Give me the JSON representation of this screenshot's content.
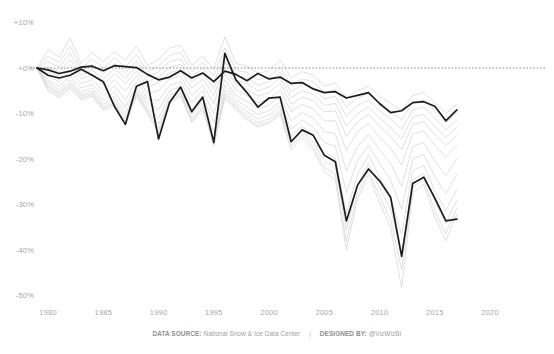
{
  "footer": {
    "source_label": "DATA SOURCE:",
    "source_value": "National Snow & Ice Data Center",
    "separator": "|",
    "designer_label": "DESIGNED BY:",
    "designer_value": "@VizWizBI"
  },
  "colors": {
    "background": "#ffffff",
    "axis_text": "#a6a6a6",
    "context_line": "#d6d6d6",
    "highlight_line": "#1d1d1d",
    "zero_reference_line": "#6f6f6f"
  },
  "chart_data": {
    "type": "line",
    "title": "",
    "subtitle": "",
    "xlabel": "",
    "ylabel": "",
    "xlim": [
      1979,
      2021
    ],
    "ylim": [
      -52,
      12
    ],
    "grid": false,
    "legend_position": "none",
    "y_tick_labels": [
      "+10%",
      "+0%",
      "-10%",
      "-20%",
      "-30%",
      "-40%",
      "-50%"
    ],
    "y_tick_values": [
      10,
      0,
      -10,
      -20,
      -30,
      -40,
      -50
    ],
    "x_tick_labels": [
      "1980",
      "1985",
      "1990",
      "1995",
      "2000",
      "2005",
      "2010",
      "2015",
      "2020"
    ],
    "x_tick_values": [
      1980,
      1985,
      1990,
      1995,
      2000,
      2005,
      2010,
      2015,
      2020
    ],
    "annotations": [
      {
        "name": "zero-reference-line",
        "type": "hline",
        "value": 0,
        "style": "dotted"
      }
    ],
    "x": [
      1979,
      1980,
      1981,
      1982,
      1983,
      1984,
      1985,
      1986,
      1987,
      1988,
      1989,
      1990,
      1991,
      1992,
      1993,
      1994,
      1995,
      1996,
      1997,
      1998,
      1999,
      2000,
      2001,
      2002,
      2003,
      2004,
      2005,
      2006,
      2007,
      2008,
      2009,
      2010,
      2011,
      2012,
      2013,
      2014,
      2015,
      2016,
      2017
    ],
    "series": [
      {
        "name": "Highlighted A",
        "emphasis": "high",
        "color": "#1d1d1d",
        "values": [
          0.0,
          -0.4,
          -1.2,
          -0.7,
          0.2,
          0.4,
          -0.6,
          0.5,
          0.3,
          0.1,
          -1.4,
          -2.6,
          -2.0,
          -0.6,
          -2.2,
          -1.1,
          -3.0,
          -0.7,
          -1.4,
          -2.8,
          -1.2,
          -2.4,
          -2.0,
          -3.4,
          -3.2,
          -4.6,
          -5.4,
          -5.2,
          -6.6,
          -6.0,
          -5.4,
          -7.8,
          -9.8,
          -9.4,
          -7.6,
          -7.4,
          -8.4,
          -11.6,
          -9.2
        ]
      },
      {
        "name": "Highlighted B",
        "emphasis": "high",
        "color": "#1d1d1d",
        "values": [
          0.0,
          -1.6,
          -2.2,
          -1.6,
          -0.3,
          -1.6,
          -3.0,
          -8.4,
          -12.4,
          -4.0,
          -3.0,
          -15.6,
          -7.6,
          -4.2,
          -9.6,
          -6.4,
          -16.4,
          3.2,
          -2.6,
          -5.4,
          -8.6,
          -6.6,
          -6.4,
          -16.2,
          -13.6,
          -14.8,
          -19.2,
          -20.6,
          -33.6,
          -25.8,
          -22.2,
          -24.8,
          -28.4,
          -41.4,
          -25.4,
          -24.0,
          -28.6,
          -33.6,
          -33.2
        ]
      },
      {
        "name": "Context 1",
        "emphasis": "low",
        "color": "#d6d6d6",
        "values": [
          0.0,
          4.0,
          2.4,
          6.6,
          1.0,
          3.4,
          1.4,
          3.6,
          1.8,
          4.8,
          0.6,
          1.8,
          4.4,
          5.0,
          0.6,
          2.6,
          -0.2,
          6.8,
          1.0,
          0.4,
          -1.2,
          -0.6,
          1.8,
          -2.2,
          -0.8,
          -1.6,
          -4.0,
          -3.2,
          -6.6,
          -5.0,
          -4.0,
          -6.2,
          -7.8,
          -9.4,
          -6.0,
          -5.4,
          -7.6,
          -10.0,
          -8.0
        ]
      },
      {
        "name": "Context 2",
        "emphasis": "low",
        "color": "#d6d6d6",
        "values": [
          0.0,
          2.6,
          1.2,
          4.8,
          0.0,
          2.0,
          0.0,
          2.2,
          0.2,
          3.0,
          -0.8,
          0.4,
          2.8,
          3.4,
          -0.8,
          1.2,
          -1.8,
          4.4,
          -0.4,
          -1.0,
          -2.6,
          -2.0,
          0.2,
          -3.8,
          -2.4,
          -3.0,
          -5.4,
          -4.8,
          -8.6,
          -6.6,
          -5.6,
          -8.0,
          -9.6,
          -11.4,
          -7.6,
          -7.0,
          -9.4,
          -12.0,
          -9.8
        ]
      },
      {
        "name": "Context 3",
        "emphasis": "low",
        "color": "#d6d6d6",
        "values": [
          0.0,
          1.4,
          0.2,
          3.2,
          -0.8,
          0.8,
          -1.2,
          1.0,
          -1.0,
          1.6,
          -2.0,
          -0.8,
          1.4,
          2.0,
          -2.0,
          0.0,
          -3.2,
          2.8,
          -1.6,
          -2.2,
          -3.8,
          -3.0,
          -1.0,
          -5.2,
          -3.6,
          -4.4,
          -6.8,
          -6.2,
          -10.6,
          -8.2,
          -7.0,
          -9.4,
          -11.2,
          -13.4,
          -9.2,
          -8.6,
          -11.0,
          -13.6,
          -11.4
        ]
      },
      {
        "name": "Context 4",
        "emphasis": "low",
        "color": "#d6d6d6",
        "values": [
          0.0,
          0.2,
          -0.8,
          1.8,
          -1.6,
          -0.4,
          -2.4,
          -0.2,
          -2.2,
          0.4,
          -3.0,
          -2.0,
          0.2,
          0.8,
          -3.2,
          -1.2,
          -4.6,
          1.4,
          -2.6,
          -3.4,
          -5.0,
          -4.2,
          -2.2,
          -6.6,
          -5.0,
          -5.8,
          -8.2,
          -7.8,
          -12.8,
          -10.0,
          -8.6,
          -11.0,
          -13.0,
          -15.6,
          -10.8,
          -10.2,
          -12.8,
          -15.2,
          -13.0
        ]
      },
      {
        "name": "Context 5",
        "emphasis": "low",
        "color": "#d6d6d6",
        "values": [
          0.0,
          -0.8,
          -1.8,
          0.6,
          -2.4,
          -1.4,
          -3.6,
          -1.2,
          -3.4,
          -0.6,
          -4.2,
          -3.2,
          -1.0,
          -0.4,
          -4.4,
          -2.4,
          -6.0,
          0.2,
          -3.6,
          -4.6,
          -6.2,
          -5.4,
          -3.4,
          -8.0,
          -6.4,
          -7.2,
          -9.6,
          -9.4,
          -15.0,
          -11.8,
          -10.2,
          -12.8,
          -15.0,
          -18.0,
          -12.4,
          -11.8,
          -14.6,
          -17.0,
          -14.8
        ]
      },
      {
        "name": "Context 6",
        "emphasis": "low",
        "color": "#d6d6d6",
        "values": [
          0.0,
          -1.8,
          -3.0,
          -0.6,
          -3.4,
          -2.6,
          -5.0,
          -2.6,
          -5.0,
          -1.8,
          -5.6,
          -5.0,
          -2.4,
          -1.8,
          -6.0,
          -3.8,
          -7.8,
          -1.2,
          -4.8,
          -6.0,
          -7.6,
          -6.8,
          -4.8,
          -9.6,
          -8.0,
          -9.0,
          -11.6,
          -11.6,
          -18.2,
          -14.0,
          -12.2,
          -15.2,
          -17.6,
          -21.4,
          -14.4,
          -13.8,
          -17.0,
          -19.6,
          -17.0
        ]
      },
      {
        "name": "Context 7",
        "emphasis": "low",
        "color": "#d6d6d6",
        "values": [
          0.0,
          -2.6,
          -4.0,
          -1.8,
          -4.4,
          -3.6,
          -6.2,
          -4.0,
          -7.0,
          -3.0,
          -6.8,
          -7.2,
          -3.8,
          -3.0,
          -7.6,
          -5.0,
          -10.0,
          -2.6,
          -6.0,
          -7.4,
          -9.0,
          -8.2,
          -6.2,
          -11.6,
          -9.8,
          -11.0,
          -14.0,
          -14.4,
          -22.6,
          -17.2,
          -14.6,
          -18.0,
          -21.0,
          -26.0,
          -17.2,
          -16.4,
          -20.4,
          -23.6,
          -20.0
        ]
      },
      {
        "name": "Context 8",
        "emphasis": "low",
        "color": "#d6d6d6",
        "values": [
          0.0,
          -3.2,
          -4.8,
          -2.6,
          -5.2,
          -4.4,
          -7.2,
          -5.2,
          -8.6,
          -4.0,
          -7.8,
          -9.2,
          -5.0,
          -4.0,
          -9.0,
          -6.2,
          -12.0,
          -3.8,
          -7.0,
          -8.6,
          -10.2,
          -9.4,
          -7.4,
          -13.4,
          -11.4,
          -13.0,
          -16.4,
          -17.2,
          -27.4,
          -20.4,
          -17.0,
          -21.0,
          -24.6,
          -31.0,
          -20.0,
          -19.0,
          -23.8,
          -27.6,
          -23.4
        ]
      },
      {
        "name": "Context 9",
        "emphasis": "low",
        "color": "#d6d6d6",
        "values": [
          0.0,
          -3.8,
          -5.4,
          -3.2,
          -5.8,
          -5.0,
          -8.0,
          -6.2,
          -10.0,
          -4.8,
          -8.6,
          -11.0,
          -6.0,
          -4.8,
          -10.2,
          -7.2,
          -14.0,
          -4.8,
          -7.8,
          -9.6,
          -11.2,
          -10.4,
          -8.4,
          -15.0,
          -12.8,
          -14.8,
          -18.6,
          -19.8,
          -32.0,
          -23.4,
          -19.2,
          -24.0,
          -28.2,
          -36.6,
          -22.6,
          -21.4,
          -27.0,
          -31.4,
          -26.6
        ]
      },
      {
        "name": "Context 10",
        "emphasis": "low",
        "color": "#d6d6d6",
        "values": [
          0.0,
          -4.2,
          -5.8,
          -3.6,
          -6.2,
          -5.4,
          -8.6,
          -7.0,
          -11.0,
          -5.4,
          -9.2,
          -12.4,
          -6.8,
          -5.4,
          -11.0,
          -8.0,
          -15.4,
          -5.6,
          -8.4,
          -10.4,
          -12.0,
          -11.2,
          -9.2,
          -16.2,
          -13.8,
          -16.2,
          -20.4,
          -21.8,
          -35.6,
          -25.6,
          -21.0,
          -26.4,
          -31.0,
          -41.0,
          -24.6,
          -23.2,
          -29.4,
          -34.2,
          -29.0
        ]
      },
      {
        "name": "Context 11",
        "emphasis": "low",
        "color": "#d6d6d6",
        "values": [
          0.0,
          -4.6,
          -6.2,
          -4.0,
          -6.6,
          -5.8,
          -9.0,
          -7.6,
          -11.8,
          -5.8,
          -9.6,
          -13.4,
          -7.4,
          -5.8,
          -11.6,
          -8.6,
          -16.4,
          -6.2,
          -8.8,
          -11.0,
          -12.6,
          -11.8,
          -9.8,
          -17.2,
          -14.6,
          -17.2,
          -21.8,
          -23.4,
          -38.2,
          -27.4,
          -22.4,
          -28.2,
          -33.2,
          -44.4,
          -26.2,
          -24.6,
          -31.4,
          -36.4,
          -30.8
        ]
      },
      {
        "name": "Context 12",
        "emphasis": "low",
        "color": "#d6d6d6",
        "values": [
          0.0,
          -5.0,
          -6.6,
          -4.4,
          -7.0,
          -6.2,
          -9.4,
          -8.0,
          -12.4,
          -6.2,
          -10.0,
          -14.2,
          -7.8,
          -6.2,
          -12.0,
          -9.0,
          -17.2,
          -6.6,
          -9.2,
          -11.4,
          -13.0,
          -12.2,
          -10.2,
          -18.0,
          -15.2,
          -18.0,
          -22.8,
          -24.6,
          -40.0,
          -28.8,
          -23.4,
          -29.6,
          -35.0,
          -48.4,
          -27.4,
          -25.6,
          -32.8,
          -38.0,
          -32.2
        ]
      }
    ]
  }
}
